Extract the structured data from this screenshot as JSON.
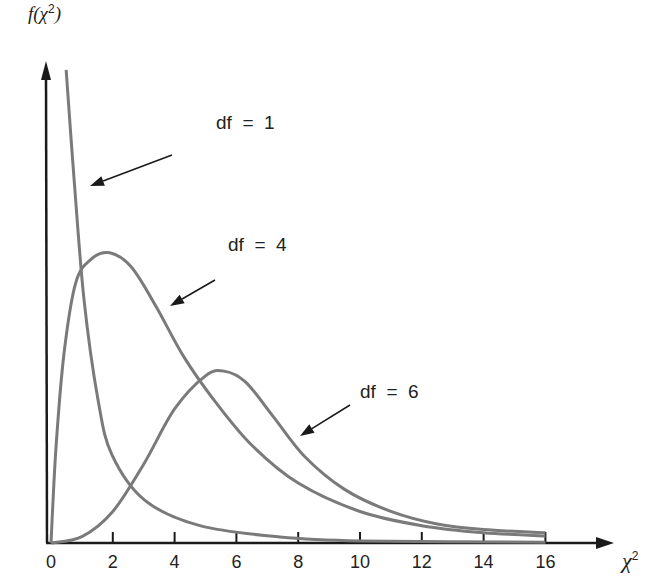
{
  "chart_data": {
    "type": "line",
    "title": "",
    "xlabel": "χ²",
    "ylabel": "f(χ²)",
    "xlim": [
      0,
      16
    ],
    "x_ticks": [
      0,
      2,
      4,
      6,
      8,
      10,
      12,
      14,
      16
    ],
    "grid": false,
    "legend": "inline annotations with arrows",
    "series": [
      {
        "name": "df = 1",
        "points": [
          [
            0.49,
            0.3
          ],
          [
            0.75,
            0.23
          ],
          [
            1.07,
            0.154
          ],
          [
            1.52,
            0.091
          ],
          [
            1.97,
            0.056
          ],
          [
            3.04,
            0.027
          ],
          [
            4.82,
            0.011
          ],
          [
            7.41,
            0.0038
          ],
          [
            10.0,
            0.0013
          ],
          [
            16.0,
            0.0005
          ]
        ]
      },
      {
        "name": "df = 4",
        "points": [
          [
            0.0,
            0.0
          ],
          [
            0.16,
            0.06
          ],
          [
            0.42,
            0.12
          ],
          [
            0.8,
            0.165
          ],
          [
            1.3,
            0.18
          ],
          [
            1.9,
            0.184
          ],
          [
            2.6,
            0.175
          ],
          [
            3.4,
            0.15
          ],
          [
            4.3,
            0.118
          ],
          [
            5.3,
            0.09
          ],
          [
            6.5,
            0.062
          ],
          [
            8.0,
            0.038
          ],
          [
            10.0,
            0.02
          ],
          [
            12.0,
            0.011
          ],
          [
            14.0,
            0.0065
          ],
          [
            16.0,
            0.0045
          ]
        ]
      },
      {
        "name": "df = 6",
        "points": [
          [
            0.0,
            0.0
          ],
          [
            1.0,
            0.004
          ],
          [
            2.0,
            0.02
          ],
          [
            3.0,
            0.05
          ],
          [
            4.0,
            0.085
          ],
          [
            5.0,
            0.106
          ],
          [
            5.6,
            0.109
          ],
          [
            6.3,
            0.102
          ],
          [
            7.2,
            0.08
          ],
          [
            8.2,
            0.055
          ],
          [
            9.5,
            0.034
          ],
          [
            11.0,
            0.02
          ],
          [
            12.5,
            0.012
          ],
          [
            14.0,
            0.0085
          ],
          [
            16.0,
            0.0065
          ]
        ]
      }
    ],
    "annotations": [
      {
        "text": "df = 1",
        "x": 216,
        "y": 124
      },
      {
        "text": "df = 4",
        "x": 228,
        "y": 246
      },
      {
        "text": "df = 6",
        "x": 360,
        "y": 393
      }
    ]
  },
  "axis": {
    "y_label_prefix": "f(χ",
    "y_label_sup": "2",
    "y_label_suffix": ")",
    "x_label": "χ",
    "x_label_sup": "2"
  },
  "colors": {
    "curve": "#7a7a7a",
    "axis": "#1a1a1a"
  }
}
